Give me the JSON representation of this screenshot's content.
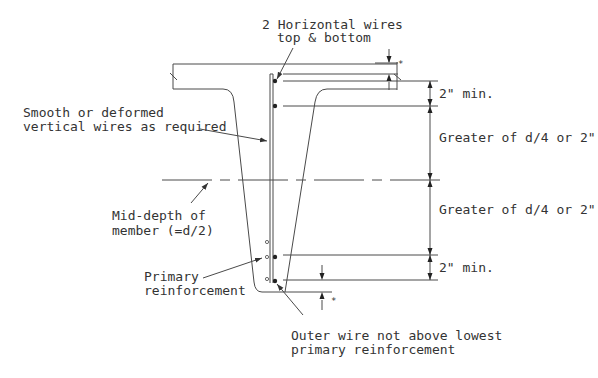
{
  "labels": {
    "top_wires_line1": "2 Horizontal wires",
    "top_wires_line2": "top & bottom",
    "vertical_wires_line1": "Smooth or deformed",
    "vertical_wires_line2": "vertical wires as required",
    "mid_depth_line1": "Mid-depth of",
    "mid_depth_line2": "member (=d/2)",
    "primary_line1": "Primary",
    "primary_line2": "reinforcement",
    "outer_wire_line1": "Outer wire not above lowest",
    "outer_wire_line2": "primary reinforcement",
    "dim_top_min": "2\" min.",
    "dim_upper_greater": "Greater of d/4 or 2\"",
    "dim_lower_greater": "Greater of d/4 or 2\"",
    "dim_bottom_min": "2\" min.",
    "star_top": "*",
    "star_bottom": "*"
  },
  "colors": {
    "line": "#4a4a4a",
    "text": "#333333",
    "background": "#ffffff"
  }
}
